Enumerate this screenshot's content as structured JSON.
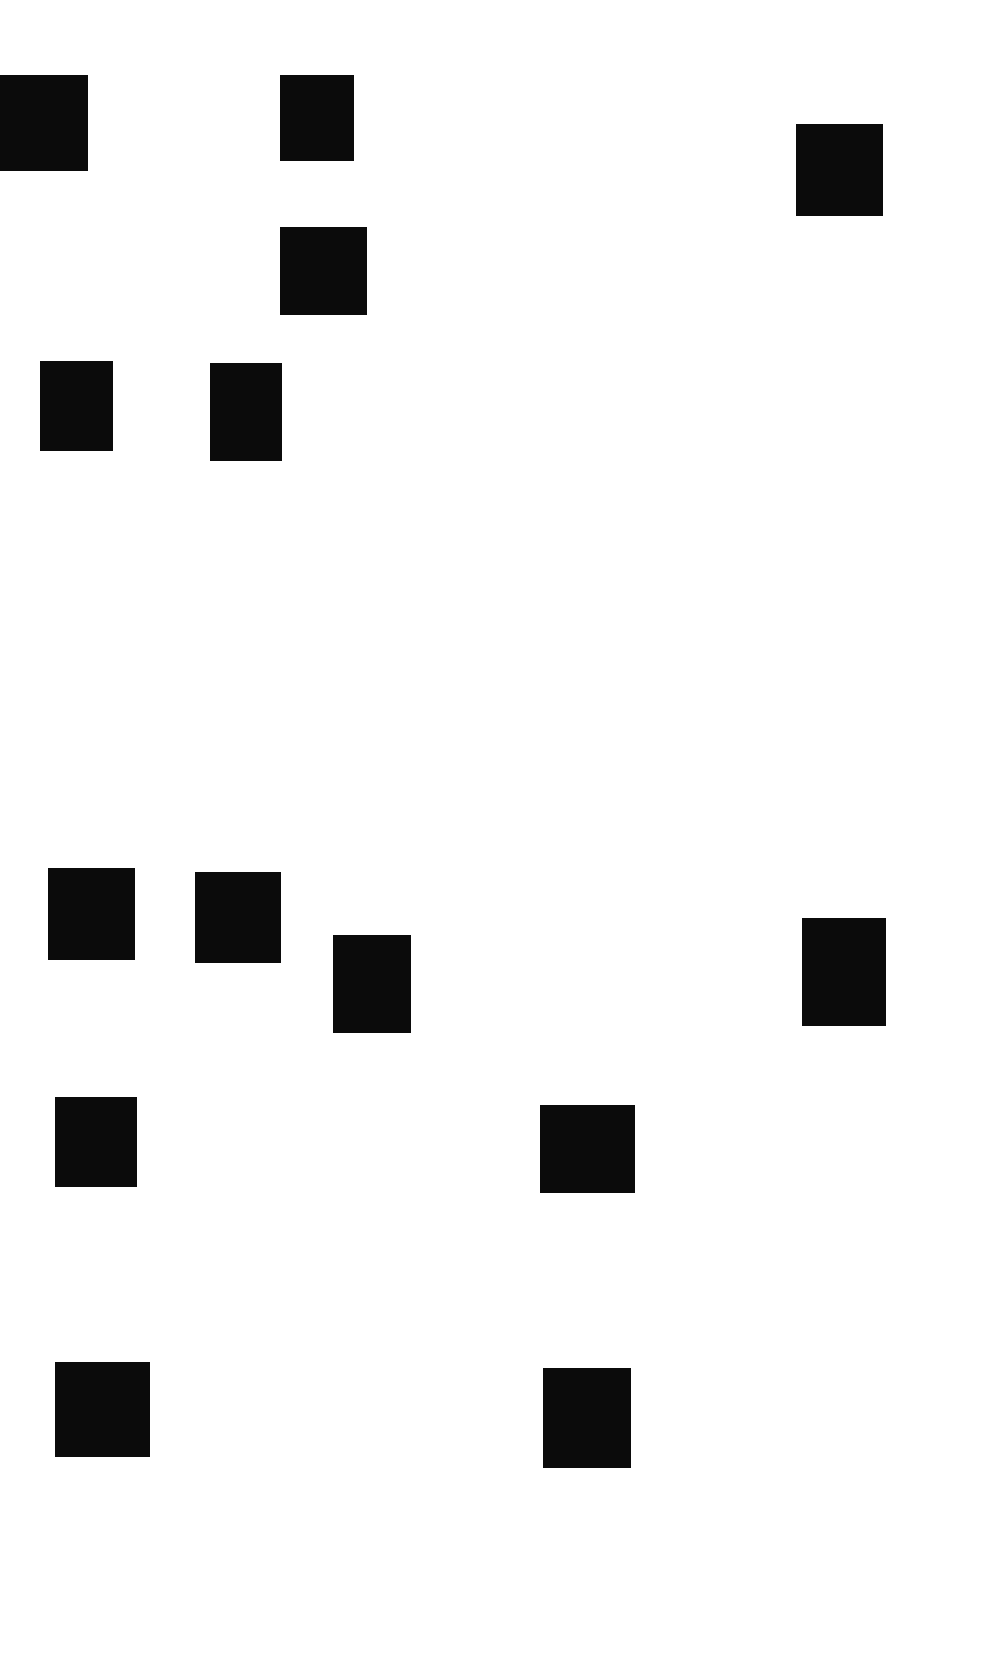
{
  "document": {
    "background": "#ffffff",
    "redaction_color": "#0b0b0b",
    "redactions": [
      {
        "x": 0,
        "y": 75,
        "w": 88,
        "h": 96
      },
      {
        "x": 280,
        "y": 75,
        "w": 74,
        "h": 86
      },
      {
        "x": 796,
        "y": 124,
        "w": 87,
        "h": 92
      },
      {
        "x": 280,
        "y": 227,
        "w": 87,
        "h": 88
      },
      {
        "x": 40,
        "y": 361,
        "w": 73,
        "h": 90
      },
      {
        "x": 210,
        "y": 363,
        "w": 72,
        "h": 98
      },
      {
        "x": 48,
        "y": 868,
        "w": 87,
        "h": 92
      },
      {
        "x": 195,
        "y": 872,
        "w": 86,
        "h": 91
      },
      {
        "x": 333,
        "y": 935,
        "w": 78,
        "h": 98
      },
      {
        "x": 802,
        "y": 918,
        "w": 84,
        "h": 108
      },
      {
        "x": 55,
        "y": 1097,
        "w": 82,
        "h": 90
      },
      {
        "x": 540,
        "y": 1105,
        "w": 95,
        "h": 88
      },
      {
        "x": 55,
        "y": 1362,
        "w": 95,
        "h": 95
      },
      {
        "x": 543,
        "y": 1368,
        "w": 88,
        "h": 100
      }
    ]
  }
}
